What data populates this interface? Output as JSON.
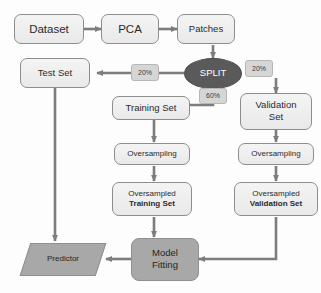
{
  "diagram": {
    "colors": {
      "box_fill": "#ededed",
      "box_border": "#8d8d8d",
      "tag_fill": "#d6d6d6",
      "ellipse_fill": "#5a5a5a",
      "gray_fill": "#a8a8a8",
      "arrow": "#7d7d7d",
      "text": "#2b2b2b",
      "ellipse_text": "#ffffff"
    },
    "nodes": {
      "dataset": {
        "label": "Dataset",
        "shape": "rounded-rect"
      },
      "pca": {
        "label": "PCA",
        "shape": "rounded-rect"
      },
      "patches": {
        "label": "Patches",
        "shape": "rounded-rect"
      },
      "split": {
        "label": "SPLIT",
        "shape": "ellipse"
      },
      "test_set": {
        "label": "Test Set",
        "shape": "rounded-rect"
      },
      "training_set": {
        "label": "Training Set",
        "shape": "rounded-rect"
      },
      "validation_set": {
        "label_line1": "Validation",
        "label_line2": "Set",
        "shape": "rounded-rect"
      },
      "oversampling_train": {
        "label": "Oversampling",
        "shape": "rounded-rect"
      },
      "oversampling_val": {
        "label": "Oversampling",
        "shape": "rounded-rect"
      },
      "oversampled_training": {
        "label_line1": "Oversampled",
        "label_line2": "Training Set",
        "shape": "rounded-rect"
      },
      "oversampled_validation": {
        "label_line1": "Oversampled",
        "label_line2": "Validation Set",
        "shape": "rounded-rect"
      },
      "model_fitting": {
        "label_line1": "Model",
        "label_line2": "Fitting",
        "shape": "rounded-rect-filled"
      },
      "predictor": {
        "label": "Predictor",
        "shape": "parallelogram"
      }
    },
    "edge_labels": {
      "split_test": "20%",
      "split_validation": "20%",
      "split_training": "60%"
    }
  }
}
